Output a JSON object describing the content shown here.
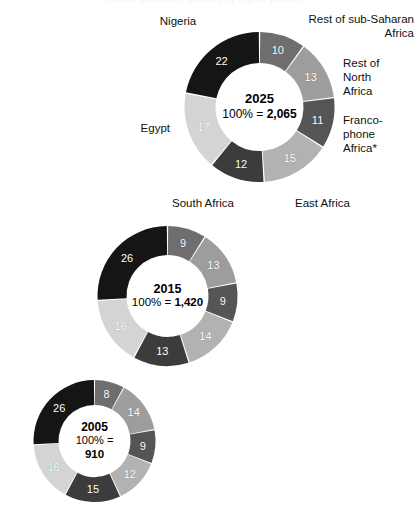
{
  "header": {
    "cut_title": "Exhibit: Consumer spending by region, percent"
  },
  "chart_data": {
    "type": "pie",
    "note": "Three concentric-style donut charts, one per year",
    "categories": [
      "Rest of sub-Saharan Africa",
      "Rest of North Africa",
      "Francophone Africa*",
      "East Africa",
      "South Africa",
      "Egypt",
      "Nigeria"
    ],
    "colors": [
      "#6e6e6e",
      "#9d9d9d",
      "#555555",
      "#b2b2b2",
      "#3c3c3c",
      "#d4d4d4",
      "#151515"
    ],
    "legend_position": "callout labels around top donut",
    "charts": [
      {
        "year": "2025",
        "total_prefix": "100% = ",
        "total": "2,065",
        "values": [
          10,
          13,
          11,
          15,
          12,
          17,
          22
        ]
      },
      {
        "year": "2015",
        "total_prefix": "100% = ",
        "total": "1,420",
        "values": [
          9,
          13,
          9,
          14,
          13,
          16,
          26
        ]
      },
      {
        "year": "2005",
        "total_prefix": "100% =",
        "total": "910",
        "values": [
          8,
          14,
          9,
          12,
          15,
          16,
          26
        ]
      }
    ]
  },
  "callouts": {
    "nigeria": "Nigeria",
    "rest_sub_saharan": "Rest of sub-Saharan\nAfrica",
    "rest_north": "Rest of\nNorth\nAfrica",
    "francophone": "Franco-\nphone\nAfrica*",
    "east_africa": "East Africa",
    "south_africa": "South Africa",
    "egypt": "Egypt"
  },
  "values_2025": {
    "s0": "10",
    "s1": "13",
    "s2": "11",
    "s3": "15",
    "s4": "12",
    "s5": "17",
    "s6": "22"
  },
  "values_2015": {
    "s0": "9",
    "s1": "13",
    "s2": "9",
    "s3": "14",
    "s4": "13",
    "s5": "16",
    "s6": "26"
  },
  "values_2005": {
    "s0": "8",
    "s1": "14",
    "s2": "9",
    "s3": "12",
    "s4": "15",
    "s5": "16",
    "s6": "26"
  },
  "centers": {
    "y2025_year": "2025",
    "y2025_total": "100% = 2,065",
    "y2015_year": "2015",
    "y2015_total": "100% = 1,420",
    "y2005_year": "2005",
    "y2005_total_line1": "100% =",
    "y2005_total_line2": "910"
  }
}
